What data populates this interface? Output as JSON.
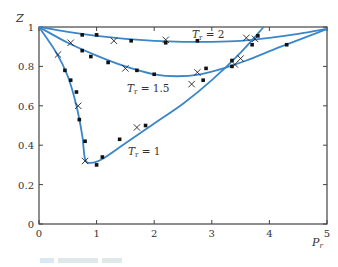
{
  "chart_data": {
    "type": "line",
    "title": "",
    "xlabel": "P_r",
    "ylabel": "Z",
    "xlim": [
      0,
      5
    ],
    "ylim": [
      0,
      1
    ],
    "xticks": [
      0,
      1,
      2,
      3,
      4,
      5
    ],
    "yticks": [
      0,
      0.2,
      0.4,
      0.6,
      0.8,
      1
    ],
    "xtick_labels": [
      "0",
      "1",
      "2",
      "3",
      "4",
      "5"
    ],
    "ytick_labels": [
      "0",
      "0.2",
      "0.4",
      "0.6",
      "0.8",
      "1"
    ],
    "grid": false,
    "line_color": "#3a86c8",
    "series": [
      {
        "name": "T_r = 2",
        "label": "Tr = 2",
        "curve": [
          [
            0,
            1.0
          ],
          [
            0.5,
            0.975
          ],
          [
            1,
            0.955
          ],
          [
            1.5,
            0.94
          ],
          [
            2,
            0.93
          ],
          [
            2.5,
            0.925
          ],
          [
            3,
            0.925
          ],
          [
            3.5,
            0.93
          ],
          [
            4,
            0.945
          ],
          [
            4.5,
            0.965
          ],
          [
            5,
            0.99
          ]
        ],
        "points_dot": [
          [
            0.75,
            0.96
          ],
          [
            1.0,
            0.96
          ],
          [
            1.6,
            0.93
          ],
          [
            2.2,
            0.92
          ],
          [
            2.75,
            0.93
          ],
          [
            3.8,
            0.955
          ]
        ],
        "points_cross": [
          [
            1.3,
            0.93
          ],
          [
            2.2,
            0.935
          ],
          [
            3.6,
            0.945
          ]
        ]
      },
      {
        "name": "T_r = 1.5",
        "label": "Tr = 1.5",
        "curve": [
          [
            0,
            1.0
          ],
          [
            0.5,
            0.92
          ],
          [
            1,
            0.855
          ],
          [
            1.5,
            0.8
          ],
          [
            2,
            0.76
          ],
          [
            2.4,
            0.75
          ],
          [
            2.8,
            0.76
          ],
          [
            3.2,
            0.79
          ],
          [
            3.6,
            0.83
          ],
          [
            4.2,
            0.9
          ],
          [
            5,
            0.99
          ]
        ],
        "points_dot": [
          [
            0.75,
            0.88
          ],
          [
            0.9,
            0.85
          ],
          [
            1.2,
            0.82
          ],
          [
            1.7,
            0.78
          ],
          [
            2.0,
            0.76
          ],
          [
            2.9,
            0.79
          ],
          [
            3.35,
            0.83
          ],
          [
            4.3,
            0.91
          ]
        ],
        "points_cross": [
          [
            0.55,
            0.92
          ],
          [
            1.5,
            0.79
          ],
          [
            2.75,
            0.77
          ],
          [
            3.5,
            0.84
          ]
        ]
      },
      {
        "name": "T_r = 1",
        "label": "Tr = 1",
        "curve": [
          [
            0,
            1.0
          ],
          [
            0.3,
            0.87
          ],
          [
            0.5,
            0.75
          ],
          [
            0.65,
            0.6
          ],
          [
            0.75,
            0.45
          ],
          [
            0.8,
            0.33
          ],
          [
            0.9,
            0.31
          ],
          [
            1.1,
            0.33
          ],
          [
            1.5,
            0.41
          ],
          [
            2,
            0.51
          ],
          [
            2.5,
            0.61
          ],
          [
            3,
            0.73
          ],
          [
            3.5,
            0.87
          ],
          [
            3.9,
            1.0
          ]
        ],
        "points_dot": [
          [
            0.45,
            0.78
          ],
          [
            0.55,
            0.73
          ],
          [
            0.65,
            0.67
          ],
          [
            0.7,
            0.53
          ],
          [
            0.8,
            0.42
          ],
          [
            1.0,
            0.3
          ],
          [
            1.1,
            0.34
          ],
          [
            1.4,
            0.43
          ],
          [
            1.85,
            0.5
          ],
          [
            2.85,
            0.73
          ],
          [
            3.35,
            0.8
          ],
          [
            3.7,
            0.91
          ]
        ],
        "points_cross": [
          [
            0.33,
            0.86
          ],
          [
            0.68,
            0.6
          ],
          [
            0.8,
            0.32
          ],
          [
            1.7,
            0.49
          ],
          [
            2.65,
            0.71
          ],
          [
            3.4,
            0.81
          ],
          [
            3.75,
            0.94
          ]
        ]
      }
    ],
    "annotations": [
      {
        "text": "Tr = 2",
        "x": 2.55,
        "y": 0.95
      },
      {
        "text": "Tr = 1.5",
        "x": 1.6,
        "y": 0.68
      },
      {
        "text": "Tr = 1",
        "x": 2.0,
        "y": 0.33
      }
    ]
  },
  "labels": {
    "y_axis": "Z",
    "x_axis_main": "P",
    "x_axis_sub": "r",
    "curve_tr2_main": "T",
    "curve_tr2_rest": " = 2",
    "curve_tr15_main": "T",
    "curve_tr15_rest": " = 1.5",
    "curve_tr1_main": "T",
    "curve_tr1_rest": " = 1",
    "sub": "r"
  }
}
